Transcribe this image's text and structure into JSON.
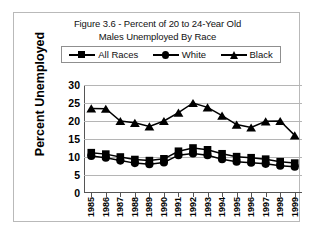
{
  "figure": {
    "title_line1": "Figure 3.6 - Percent of 20 to 24-Year Old",
    "title_line2": "Males Unemployed By Race",
    "y_axis_title": "Percent Unemployed"
  },
  "legend": {
    "position": "top-inside",
    "entries": [
      {
        "label": "All Races",
        "marker": "square-marker-icon",
        "color": "#000000"
      },
      {
        "label": "White",
        "marker": "circle-marker-icon",
        "color": "#000000"
      },
      {
        "label": "Black",
        "marker": "triangle-marker-icon",
        "color": "#000000"
      }
    ]
  },
  "colors": {
    "series": "#000000",
    "gridline": "#b5b5b5",
    "axis": "#555555",
    "frame": "#b9b9b9",
    "background": "#ffffff"
  },
  "chart_data": {
    "type": "line",
    "title": "Figure 3.6 - Percent of 20 to 24-Year Old Males Unemployed By Race",
    "xlabel": "",
    "ylabel": "Percent Unemployed",
    "ylim": [
      0,
      30
    ],
    "yticks": [
      0,
      5,
      10,
      15,
      20,
      25,
      30
    ],
    "grid": true,
    "legend_position": "top-inside",
    "x": [
      "1985",
      "1986",
      "1987",
      "1988",
      "1989",
      "1990",
      "1991",
      "1992",
      "1993",
      "1994",
      "1995",
      "1996",
      "1997",
      "1998",
      "1999"
    ],
    "categories": [
      "1985",
      "1986",
      "1987",
      "1988",
      "1989",
      "1990",
      "1991",
      "1992",
      "1993",
      "1994",
      "1995",
      "1996",
      "1997",
      "1998",
      "1999"
    ],
    "series": [
      {
        "name": "All Races",
        "marker": "square",
        "values": [
          11.2,
          10.8,
          10.0,
          9.3,
          9.0,
          9.5,
          11.6,
          12.5,
          12.0,
          10.9,
          10.1,
          9.8,
          9.4,
          8.7,
          8.3
        ]
      },
      {
        "name": "White",
        "marker": "circle",
        "values": [
          10.3,
          9.8,
          9.0,
          8.3,
          8.0,
          8.5,
          10.5,
          11.0,
          10.5,
          9.4,
          8.7,
          8.4,
          8.1,
          7.6,
          7.3
        ]
      },
      {
        "name": "Black",
        "marker": "triangle",
        "values": [
          23.5,
          23.4,
          20.0,
          19.5,
          18.5,
          20.0,
          22.3,
          25.0,
          23.8,
          21.5,
          19.0,
          18.2,
          19.9,
          20.0,
          16.0
        ]
      }
    ]
  }
}
